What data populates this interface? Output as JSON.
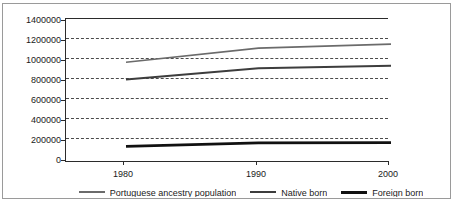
{
  "chart_data": {
    "type": "line",
    "title": "",
    "xlabel": "",
    "ylabel": "",
    "x": [
      1980,
      1990,
      2000
    ],
    "xtick_labels": [
      "1980",
      "1990",
      "2000"
    ],
    "ytick_labels": [
      "0",
      "200000",
      "400000",
      "600000",
      "800000",
      "1000000",
      "1200000",
      "1400000"
    ],
    "ytick_values": [
      0,
      200000,
      400000,
      600000,
      800000,
      1000000,
      1200000,
      1400000
    ],
    "ylim": [
      0,
      1400000
    ],
    "grid": "horizontal-dashed",
    "legend_position": "bottom",
    "series": [
      {
        "name": "Portuguese ancestry population",
        "values": [
          1020000,
          1160000,
          1200000
        ],
        "color": "#6b6b6b",
        "width": 1.6
      },
      {
        "name": "Native born",
        "values": [
          850000,
          960000,
          985000
        ],
        "color": "#3d3d3d",
        "width": 2.0
      },
      {
        "name": "Foreign born",
        "values": [
          185000,
          220000,
          222000
        ],
        "color": "#111111",
        "width": 2.6
      }
    ]
  },
  "legend": {
    "items": [
      {
        "label": "Portuguese ancestry population"
      },
      {
        "label": "Native born"
      },
      {
        "label": "Foreign born"
      }
    ]
  }
}
